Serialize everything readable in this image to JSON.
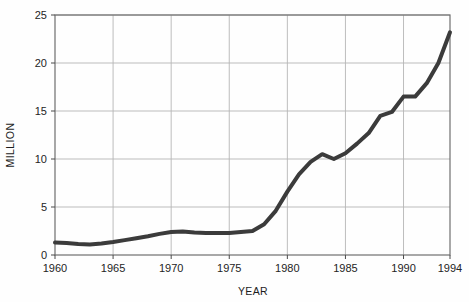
{
  "chart_data": {
    "type": "line",
    "title": "",
    "xlabel": "YEAR",
    "ylabel": "MILLION",
    "xlim": [
      1960,
      1994
    ],
    "ylim": [
      0,
      25
    ],
    "grid": true,
    "legend": "none",
    "xticks": [
      1960,
      1965,
      1970,
      1975,
      1980,
      1985,
      1990,
      1994
    ],
    "xtick_labels": [
      "1960",
      "1965",
      "1970",
      "1975",
      "1980",
      "1985",
      "1990",
      "1994"
    ],
    "yticks": [
      0,
      5,
      10,
      15,
      20,
      25
    ],
    "ytick_labels": [
      "0",
      "5",
      "10",
      "15",
      "20",
      "25"
    ],
    "series": [
      {
        "name": "value",
        "color": "#3b3b3b",
        "line_width": 4,
        "x": [
          1960,
          1961,
          1962,
          1963,
          1964,
          1965,
          1966,
          1967,
          1968,
          1969,
          1970,
          1971,
          1972,
          1973,
          1974,
          1975,
          1976,
          1977,
          1978,
          1979,
          1980,
          1981,
          1982,
          1983,
          1984,
          1985,
          1986,
          1987,
          1988,
          1989,
          1990,
          1991,
          1992,
          1993,
          1994
        ],
        "values": [
          1.3,
          1.25,
          1.15,
          1.1,
          1.2,
          1.35,
          1.55,
          1.75,
          1.95,
          2.2,
          2.4,
          2.45,
          2.35,
          2.3,
          2.3,
          2.3,
          2.4,
          2.5,
          3.2,
          4.6,
          6.6,
          8.4,
          9.7,
          10.5,
          10.0,
          10.6,
          11.6,
          12.7,
          14.5,
          14.9,
          16.5,
          16.5,
          17.9,
          20.0,
          23.2
        ]
      }
    ]
  },
  "axis": {
    "x_title": "YEAR",
    "y_title": "MILLION"
  }
}
